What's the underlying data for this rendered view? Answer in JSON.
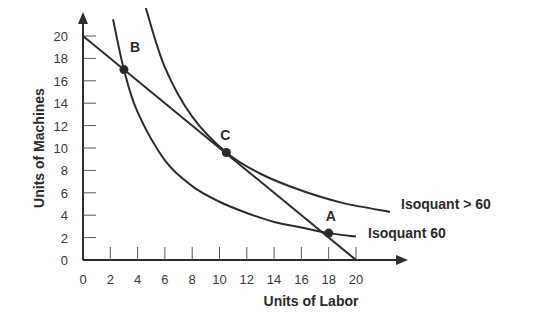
{
  "chart_data": {
    "type": "line",
    "title": "",
    "xlabel": "Units of Labor",
    "ylabel": "Units of Machines",
    "xlim": [
      0,
      20
    ],
    "ylim": [
      0,
      20
    ],
    "xticks": [
      0,
      2,
      4,
      6,
      8,
      10,
      12,
      14,
      16,
      18,
      20
    ],
    "yticks": [
      0,
      2,
      4,
      6,
      8,
      10,
      12,
      14,
      16,
      18,
      20
    ],
    "grid": false,
    "series": [
      {
        "name": "Budget line",
        "kind": "line",
        "x": [
          0,
          20
        ],
        "y": [
          20,
          0
        ]
      },
      {
        "name": "Isoquant 60",
        "kind": "curve",
        "x": [
          2.2,
          3,
          4,
          6,
          8,
          10,
          12,
          14,
          16,
          18,
          20
        ],
        "y": [
          21.5,
          17,
          13.2,
          8.9,
          6.6,
          5.2,
          4.2,
          3.4,
          2.9,
          2.4,
          2.1
        ],
        "label": "Isoquant 60"
      },
      {
        "name": "Isoquant > 60",
        "kind": "curve",
        "x": [
          4.6,
          6,
          8,
          10.5,
          13,
          16,
          19,
          22.5
        ],
        "y": [
          22.5,
          17.2,
          12.8,
          9.6,
          7.7,
          6.2,
          5.1,
          4.3
        ],
        "label": "Isoquant > 60"
      }
    ],
    "points": [
      {
        "label": "B",
        "x": 3,
        "y": 17
      },
      {
        "label": "C",
        "x": 10.5,
        "y": 9.6
      },
      {
        "label": "A",
        "x": 18,
        "y": 2.4
      }
    ]
  }
}
